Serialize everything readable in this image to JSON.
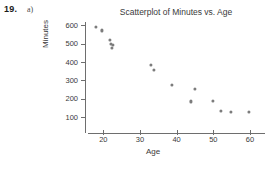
{
  "problem": {
    "number": "19.",
    "part": "a)"
  },
  "chart_data": {
    "type": "scatter",
    "title": "Scatterplot of Minutes vs. Age",
    "xlabel": "Age",
    "ylabel": "Minutes",
    "xlim": [
      15,
      63
    ],
    "ylim": [
      85,
      625
    ],
    "xticks": [
      20,
      30,
      40,
      50,
      60
    ],
    "yticks": [
      100,
      200,
      300,
      400,
      500,
      600
    ],
    "xtick_labels": [
      "20",
      "30",
      "40",
      "50",
      "60"
    ],
    "ytick_labels": [
      "100",
      "200",
      "300",
      "400",
      "500",
      "600"
    ],
    "grid": false,
    "legend": false,
    "marker_color": "#7c7c7c",
    "points": [
      {
        "x": 18.0,
        "y": 590
      },
      {
        "x": 19.6,
        "y": 572
      },
      {
        "x": 21.8,
        "y": 522
      },
      {
        "x": 22.0,
        "y": 500
      },
      {
        "x": 22.6,
        "y": 492
      },
      {
        "x": 22.3,
        "y": 478
      },
      {
        "x": 33.0,
        "y": 382
      },
      {
        "x": 33.8,
        "y": 355
      },
      {
        "x": 38.7,
        "y": 275
      },
      {
        "x": 45.0,
        "y": 255
      },
      {
        "x": 44.0,
        "y": 185
      },
      {
        "x": 50.0,
        "y": 190
      },
      {
        "x": 52.1,
        "y": 132
      },
      {
        "x": 54.8,
        "y": 128
      },
      {
        "x": 59.8,
        "y": 128
      }
    ]
  }
}
